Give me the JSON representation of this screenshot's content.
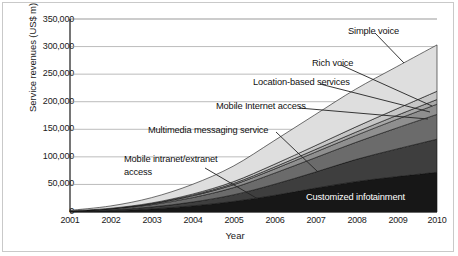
{
  "chart_data": {
    "type": "area",
    "stacked": true,
    "title": "",
    "xlabel": "Year",
    "ylabel": "Service revenues (US$ m)",
    "x": [
      2001,
      2002,
      2003,
      2004,
      2005,
      2006,
      2007,
      2008,
      2009,
      2010
    ],
    "xtick_labels": [
      "2001",
      "2002",
      "2003",
      "2004",
      "2005",
      "2006",
      "2007",
      "2008",
      "2009",
      "2010"
    ],
    "ytick_labels": [
      "0",
      "50,000",
      "100,000",
      "150,000",
      "200,000",
      "250,000",
      "300,000",
      "350,000"
    ],
    "ytick_values": [
      0,
      50000,
      100000,
      150000,
      200000,
      250000,
      300000,
      350000
    ],
    "ylim": [
      0,
      350000
    ],
    "xlim": [
      2001,
      2010
    ],
    "grid": "horizontal",
    "legend": "inline-annotations",
    "series": [
      {
        "name": "Customized infotainment",
        "color": "#171717",
        "values": [
          600,
          2200,
          5500,
          11000,
          19000,
          30000,
          43000,
          55000,
          64000,
          72000
        ]
      },
      {
        "name": "Mobile intranet/extranet access",
        "color": "#3e3e3e",
        "values": [
          400,
          1500,
          3500,
          7000,
          12000,
          20000,
          29000,
          40000,
          50000,
          60000
        ]
      },
      {
        "name": "Multimedia messaging service",
        "color": "#6b6b6b",
        "values": [
          500,
          1800,
          4200,
          8000,
          13000,
          20000,
          26000,
          31000,
          38000,
          45000
        ]
      },
      {
        "name": "Mobile Internet access",
        "color": "#8f8f8f",
        "values": [
          200,
          700,
          1700,
          3200,
          5200,
          7500,
          10000,
          12500,
          15500,
          18500
        ]
      },
      {
        "name": "Location-based services",
        "color": "#a8a8a8",
        "values": [
          100,
          300,
          700,
          1400,
          2400,
          3600,
          4800,
          6000,
          7200,
          8500
        ]
      },
      {
        "name": "Rich voice",
        "color": "#c6c6c6",
        "values": [
          100,
          300,
          800,
          1800,
          3200,
          5000,
          7000,
          9500,
          12000,
          15000
        ]
      },
      {
        "name": "Simple voice",
        "color": "#dedede",
        "values": [
          1100,
          4200,
          9600,
          17600,
          28200,
          42900,
          56200,
          68500,
          76300,
          84000
        ]
      }
    ],
    "totals": [
      3000,
      11000,
      26000,
      50000,
      83000,
      129000,
      176000,
      222500,
      263000,
      303000
    ],
    "annotations": [
      {
        "label": "Simple voice",
        "band": "Simple voice"
      },
      {
        "label": "Rich voice",
        "band": "Rich voice"
      },
      {
        "label": "Location-based services",
        "band": "Location-based services"
      },
      {
        "label": "Mobile Internet access",
        "band": "Mobile Internet access"
      },
      {
        "label": "Multimedia messaging service",
        "band": "Multimedia messaging service"
      },
      {
        "label": "Mobile intranet/extranet",
        "band": "Mobile intranet/extranet access"
      },
      {
        "label": "access",
        "band": "Mobile intranet/extranet access"
      },
      {
        "label": "Customized infotainment",
        "band": "Customized infotainment"
      }
    ]
  }
}
